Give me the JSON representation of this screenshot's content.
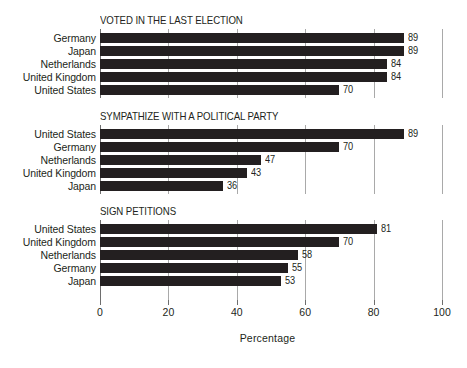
{
  "chart_data": {
    "type": "bar",
    "orientation": "horizontal",
    "title": "",
    "xlabel": "Percentage",
    "ylabel": "",
    "xlim": [
      0,
      100
    ],
    "xticks": [
      0,
      20,
      40,
      60,
      80,
      100
    ],
    "xticklabels": [
      "0",
      "20",
      "40",
      "60",
      "80",
      "100"
    ],
    "grid": "vertical",
    "legend": "none",
    "bar_color": "#231f20",
    "gridline_color": "#a9a9a9",
    "axis_color": "#6e6e6e",
    "panels": [
      {
        "title": "VOTED IN THE LAST ELECTION",
        "categories": [
          "Germany",
          "Japan",
          "Netherlands",
          "United Kingdom",
          "United States"
        ],
        "values": [
          89,
          89,
          84,
          84,
          70
        ],
        "value_labels": [
          "89",
          "89",
          "84",
          "84",
          "70"
        ]
      },
      {
        "title": "SYMPATHIZE WITH A POLITICAL PARTY",
        "categories": [
          "United States",
          "Germany",
          "Netherlands",
          "United Kingdom",
          "Japan"
        ],
        "values": [
          89,
          70,
          47,
          43,
          36
        ],
        "value_labels": [
          "89",
          "70",
          "47",
          "43",
          "36"
        ]
      },
      {
        "title": "SIGN PETITIONS",
        "categories": [
          "United States",
          "United Kingdom",
          "Netherlands",
          "Germany",
          "Japan"
        ],
        "values": [
          81,
          70,
          58,
          55,
          53
        ],
        "value_labels": [
          "81",
          "70",
          "58",
          "55",
          "53"
        ]
      }
    ]
  }
}
